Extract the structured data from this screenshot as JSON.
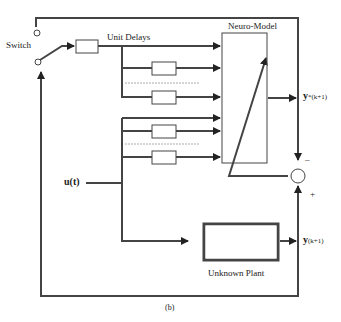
{
  "diagram": {
    "type": "block-diagram",
    "caption": "(b)",
    "labels": {
      "switch": "Switch",
      "unit_delays": "Unit Delays",
      "neuro_model": "Neuro-Model",
      "input": "u(t)",
      "model_output_main": "y",
      "model_output_sub": "*(k+1)",
      "plant_output_main": "y",
      "plant_output_sub": "(k+1)",
      "plant": "Unknown Plant",
      "minus": "–",
      "plus": "+"
    },
    "blocks": [
      {
        "id": "switch",
        "label": "Switch"
      },
      {
        "id": "unit-delays",
        "label": "Unit Delays"
      },
      {
        "id": "neuro-model",
        "label": "Neuro-Model"
      },
      {
        "id": "summing-junction",
        "label": ""
      },
      {
        "id": "unknown-plant",
        "label": "Unknown Plant"
      }
    ],
    "colors": {
      "line": "#333333",
      "background": "#ffffff"
    }
  }
}
